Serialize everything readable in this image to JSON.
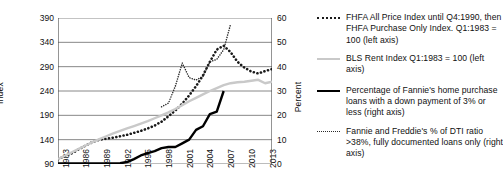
{
  "axes": {
    "y_left_title": "Index",
    "y_right_title": "Percent",
    "y_left_ticks": [
      "390",
      "340",
      "290",
      "240",
      "190",
      "140",
      "90"
    ],
    "y_right_ticks": [
      "60",
      "50",
      "40",
      "30",
      "20",
      "10",
      "0"
    ],
    "x_ticks": [
      "1983",
      "1986",
      "1989",
      "1992",
      "1995",
      "1998",
      "2001",
      "2004",
      "2007",
      "2010",
      "2013"
    ]
  },
  "legend": {
    "items": [
      {
        "marker": "fhfa-dotted-line",
        "label": "FHFA All Price Index until Q4:1990, then FHFA Purchase Only Index. Q1:1983 = 100 (left axis)"
      },
      {
        "marker": "rent-gray-line",
        "label": "BLS Rent Index Q1:1983 = 100 (left axis)"
      },
      {
        "marker": "downpayment-black-line",
        "label": "Percentage of Fannie's home purchase loans with a down payment of 3% or less (right axis)"
      },
      {
        "marker": "dti-fine-dotted-line",
        "label": "Fannie and Freddie's % of DTI ratio >38%, fully documented loans only (right axis)"
      }
    ]
  },
  "colors": {
    "fhfa": "#1a1a1a",
    "rent": "#c9c9c9",
    "downpayment": "#000000",
    "dti": "#2a2a2a",
    "grid": "#7a7a7a",
    "axis": "#4d4d4d"
  },
  "chart_data": {
    "type": "line",
    "title": "",
    "xlabel": "",
    "ylabel": "Index",
    "y2label": "Percent",
    "xlim": [
      1983,
      2014
    ],
    "ylim": [
      90,
      390
    ],
    "y2lim": [
      0,
      60
    ],
    "grid": true,
    "legend_position": "right",
    "x": [
      1983,
      1984,
      1985,
      1986,
      1987,
      1988,
      1989,
      1990,
      1991,
      1992,
      1993,
      1994,
      1995,
      1996,
      1997,
      1998,
      1999,
      2000,
      2001,
      2002,
      2003,
      2004,
      2005,
      2006,
      2007,
      2008,
      2009,
      2010,
      2011,
      2012,
      2013,
      2014
    ],
    "series": [
      {
        "name": "FHFA All Price Index until Q4:1990, then FHFA Purchase Only Index. Q1:1983 = 100 (left axis)",
        "axis": "left",
        "style": "dotted-bold",
        "values": [
          100,
          106,
          112,
          120,
          128,
          135,
          140,
          142,
          144,
          147,
          150,
          154,
          158,
          163,
          169,
          177,
          188,
          200,
          214,
          231,
          250,
          272,
          300,
          325,
          333,
          320,
          300,
          288,
          280,
          276,
          281,
          285
        ]
      },
      {
        "name": "BLS Rent Index Q1:1983 = 100 (left axis)",
        "axis": "left",
        "style": "solid-gray",
        "values": [
          100,
          107,
          114,
          121,
          128,
          135,
          141,
          147,
          153,
          158,
          163,
          168,
          173,
          178,
          184,
          190,
          196,
          203,
          211,
          219,
          226,
          233,
          240,
          246,
          252,
          256,
          258,
          259,
          261,
          263,
          256,
          259
        ]
      },
      {
        "name": "Percentage of Fannie's home purchase loans with a down payment of 3% or less (right axis)",
        "axis": "right",
        "style": "solid-black",
        "values": [
          0.2,
          0.2,
          0.2,
          0.2,
          0.2,
          0.2,
          0.2,
          0.2,
          0.2,
          0.3,
          0.8,
          2.0,
          3.5,
          4.5,
          5.3,
          6.5,
          7.0,
          7.0,
          8.5,
          10.0,
          14.0,
          15.5,
          20.5,
          21.5,
          30.0,
          null,
          null,
          null,
          null,
          null,
          null,
          null
        ]
      },
      {
        "name": "Fannie and Freddie's % of DTI ratio >38%, fully documented loans only (right axis)",
        "axis": "right",
        "style": "dotted-fine",
        "values": [
          null,
          null,
          null,
          null,
          null,
          null,
          null,
          null,
          null,
          null,
          null,
          null,
          null,
          null,
          null,
          23.5,
          25.0,
          32.0,
          41.5,
          35.5,
          34.5,
          36.0,
          42.0,
          43.0,
          47.0,
          57.5,
          null,
          null,
          null,
          null,
          null,
          null
        ]
      }
    ]
  }
}
